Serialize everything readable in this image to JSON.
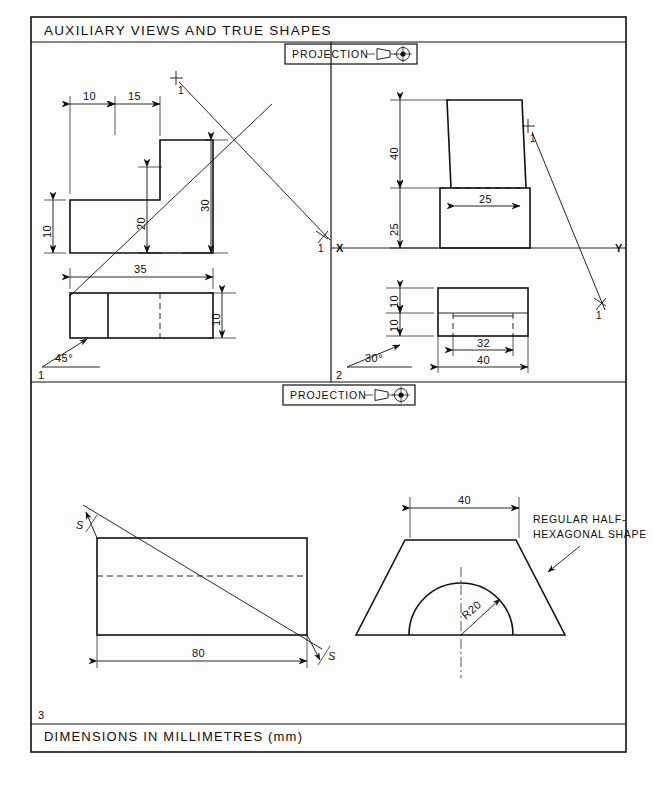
{
  "sheet": {
    "title": "AUXILIARY VIEWS AND TRUE SHAPES",
    "footer": "DIMENSIONS IN MILLIMETRES (mm)",
    "projection_label_top": "PROJECTION",
    "projection_label_mid": "PROJECTION",
    "projection_symbol": "first-angle-projection-symbol"
  },
  "panel1": {
    "problem_number": "1",
    "angle_label": "45°",
    "front_view": {
      "dims": {
        "width_left": "10",
        "width_right": "15",
        "height_bottom": "10",
        "height_mid": "20",
        "height_total": "30"
      }
    },
    "plan_view": {
      "dims": {
        "length": "35",
        "depth": "10"
      }
    },
    "aux_axis": {
      "start_label": "X",
      "start_sub": "1",
      "end_label": "Y",
      "end_sub": "1"
    }
  },
  "panel2": {
    "problem_number": "2",
    "angle_label": "30°",
    "front_view": {
      "dims": {
        "upper_height": "40",
        "lower_height": "25",
        "slot_width": "25"
      }
    },
    "plan_view": {
      "dims": {
        "front_depth": "10",
        "rear_depth": "10",
        "inner_width": "32",
        "outer_width": "40"
      }
    },
    "ground_line": {
      "left_label": "X",
      "right_label": "Y"
    },
    "aux_axis": {
      "start_label": "X",
      "start_sub": "1",
      "end_label": "Y",
      "end_sub": "1"
    }
  },
  "panel3": {
    "problem_number": "3",
    "left_view": {
      "dims": {
        "length": "80"
      },
      "section_label_top": "S",
      "section_label_bottom": "S"
    },
    "right_view": {
      "dims": {
        "top_width": "40",
        "radius": "R20"
      },
      "note": "REGULAR HALF-\nHEXAGONAL SHAPE",
      "note_line1": "REGULAR HALF-",
      "note_line2": "HEXAGONAL SHAPE"
    }
  }
}
